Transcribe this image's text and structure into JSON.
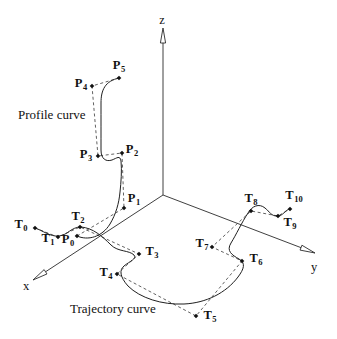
{
  "figure": {
    "width": 337,
    "height": 339,
    "background": "#ffffff",
    "ink": "#1f1f1f"
  },
  "axes": {
    "origin": {
      "x": 163,
      "y": 195
    },
    "items": [
      {
        "id": "x",
        "label": "x",
        "tip": {
          "x": 33,
          "y": 280
        },
        "label_pos": {
          "x": 26,
          "y": 286
        }
      },
      {
        "id": "y",
        "label": "y",
        "tip": {
          "x": 315,
          "y": 253
        },
        "label_pos": {
          "x": 314,
          "y": 267
        }
      },
      {
        "id": "z",
        "label": "z",
        "tip": {
          "x": 163,
          "y": 28
        },
        "label_pos": {
          "x": 162,
          "y": 20
        }
      }
    ]
  },
  "profile_curve": {
    "title": "Profile curve",
    "title_pos": {
      "x": 18,
      "y": 114
    },
    "path": "M 77,236 C 88,241 102,237 110,224 C 116,214 119,203 120,192 C 121,183 122,170 121,161 C 120,155 117,158 112,160 C 106,162 101,159 101,150 C 101,136 101,118 101,103 C 101,90 105,81 119,78",
    "points": [
      {
        "base": "P",
        "sub": "0",
        "x": 77,
        "y": 236,
        "lx": 68,
        "ly": 241
      },
      {
        "base": "P",
        "sub": "1",
        "x": 124,
        "y": 208,
        "lx": 134,
        "ly": 200
      },
      {
        "base": "P",
        "sub": "2",
        "x": 122,
        "y": 153,
        "lx": 132,
        "ly": 151
      },
      {
        "base": "P",
        "sub": "3",
        "x": 98,
        "y": 156,
        "lx": 86,
        "ly": 156
      },
      {
        "base": "P",
        "sub": "4",
        "x": 92,
        "y": 86,
        "lx": 81,
        "ly": 85
      },
      {
        "base": "P",
        "sub": "5",
        "x": 119,
        "y": 78,
        "lx": 119,
        "ly": 67
      }
    ]
  },
  "trajectory_curve": {
    "title": "Trajectory curve",
    "title_pos": {
      "x": 70,
      "y": 308
    },
    "path": "M 35,228 C 42,230 50,237 59,236 C 68,235 71,227 81,227 C 93,228 102,236 111,245 C 118,252 129,250 134,255 C 137,259 130,261 124,266 C 119,270 120,277 128,286 C 140,298 162,305 184,304 C 206,303 226,293 238,277 C 244,269 246,263 239,259 C 232,255 226,251 231,243 C 236,235 242,222 248,213 C 252,206 259,203 265,208 C 270,212 271,216 277,216 C 284,216 284,210 290,209",
    "points": [
      {
        "base": "T",
        "sub": "0",
        "x": 35,
        "y": 228,
        "lx": 21,
        "ly": 226
      },
      {
        "base": "T",
        "sub": "1",
        "x": 58,
        "y": 237,
        "lx": 48,
        "ly": 240
      },
      {
        "base": "T",
        "sub": "2",
        "x": 80,
        "y": 227,
        "lx": 78,
        "ly": 218
      },
      {
        "base": "T",
        "sub": "3",
        "x": 139,
        "y": 254,
        "lx": 152,
        "ly": 253
      },
      {
        "base": "T",
        "sub": "4",
        "x": 117,
        "y": 274,
        "lx": 106,
        "ly": 274
      },
      {
        "base": "T",
        "sub": "5",
        "x": 196,
        "y": 316,
        "lx": 210,
        "ly": 317
      },
      {
        "base": "T",
        "sub": "6",
        "x": 242,
        "y": 261,
        "lx": 256,
        "ly": 260
      },
      {
        "base": "T",
        "sub": "7",
        "x": 212,
        "y": 247,
        "lx": 202,
        "ly": 245
      },
      {
        "base": "T",
        "sub": "8",
        "x": 251,
        "y": 211,
        "lx": 251,
        "ly": 200
      },
      {
        "base": "T",
        "sub": "9",
        "x": 278,
        "y": 216,
        "lx": 290,
        "ly": 224
      },
      {
        "base": "T",
        "sub": "10",
        "x": 290,
        "y": 209,
        "lx": 294,
        "ly": 197
      }
    ]
  }
}
